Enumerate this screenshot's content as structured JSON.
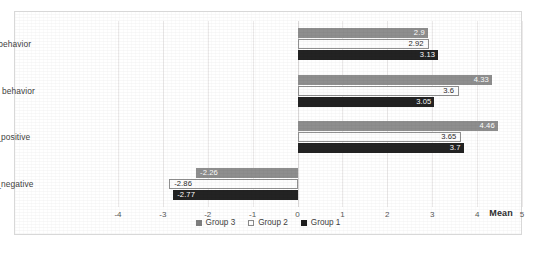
{
  "chart_data": {
    "type": "bar",
    "orientation": "horizontal",
    "title": "",
    "xlabel": "Mean",
    "ylabel": "",
    "xlim": [
      -4,
      5
    ],
    "xticks": [
      "-4",
      "-3",
      "-2",
      "-1",
      "0",
      "1",
      "2",
      "3",
      "4",
      "5"
    ],
    "grid": true,
    "legend_position": "bottom-center",
    "categories": [
      "Mitigating behavior",
      "Adaptative behavior",
      "Intentions_positive",
      "Intentions_negative"
    ],
    "series": [
      {
        "name": "Group 3",
        "color": "#8e8e8e",
        "values": [
          2.9,
          4.33,
          4.46,
          -2.26
        ],
        "labels": [
          "2.9",
          "4.33",
          "4.46",
          "-2.26"
        ]
      },
      {
        "name": "Group 2",
        "color": "#ffffff",
        "values": [
          2.92,
          3.6,
          3.65,
          -2.86
        ],
        "labels": [
          "2.92",
          "3.6",
          "3.65",
          "-2.86"
        ]
      },
      {
        "name": "Group 1",
        "color": "#232323",
        "values": [
          3.13,
          3.05,
          3.7,
          -2.77
        ],
        "labels": [
          "3.13",
          "3.05",
          "3.7",
          "-2.77"
        ]
      }
    ]
  }
}
